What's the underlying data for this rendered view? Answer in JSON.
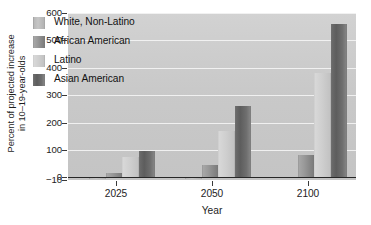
{
  "chart_data": {
    "type": "bar",
    "title": "",
    "xlabel": "Year",
    "ylabel_line1": "Percent of projected increase",
    "ylabel_line2": "in 10–19-year-olds",
    "categories": [
      "2025",
      "2050",
      "2100"
    ],
    "series": [
      {
        "name": "White, Non-Latino",
        "values": [
          -8,
          -8,
          0
        ],
        "color": "#bdbdbd"
      },
      {
        "name": "African American",
        "values": [
          15,
          45,
          80
        ],
        "color": "#8f8f8f"
      },
      {
        "name": "Latino",
        "values": [
          75,
          170,
          380
        ],
        "color": "#d2d2d2"
      },
      {
        "name": "Asian American",
        "values": [
          95,
          260,
          560
        ],
        "color": "#646464"
      }
    ],
    "ylim": [
      -10,
      600
    ],
    "yticks": [
      "600",
      "500",
      "400",
      "300",
      "200",
      "100",
      "0",
      "−10"
    ],
    "ytick_values": [
      600,
      500,
      400,
      300,
      200,
      100,
      0,
      -10
    ],
    "gridlines": [
      600,
      500,
      400,
      300,
      200,
      100
    ],
    "grid": true,
    "legend_position": "inside-upper-left",
    "zero_line": true
  },
  "legend": {
    "entries": [
      {
        "label": "White, Non-Latino"
      },
      {
        "label": "African American"
      },
      {
        "label": "Latino"
      },
      {
        "label": "Asian American"
      }
    ]
  },
  "colors": {
    "plot_background": "#c9c9c9",
    "gridline": "#f2f2f2",
    "zero_line": "#262626",
    "text": "#1d1d1d",
    "page_background": "#ffffff"
  }
}
